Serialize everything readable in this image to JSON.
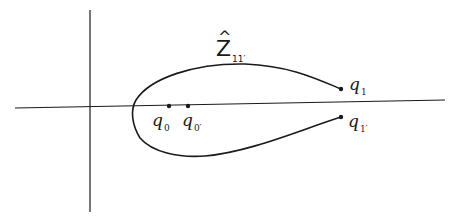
{
  "diagram": {
    "type": "curve-in-complex-plane",
    "background": "#ffffff",
    "stroke_color": "#1a1a1a",
    "axes": {
      "horizontal": {
        "x1": 15,
        "y1": 108,
        "x2": 445,
        "y2": 100
      },
      "vertical": {
        "x1": 90,
        "y1": 10,
        "x2": 90,
        "y2": 212
      }
    },
    "curve": {
      "label_main": "Z",
      "label_hat": "^",
      "label_sub": "11′",
      "path": "M341 89 C 315 78, 290 66, 245 64 C 195 63, 150 78, 136 100 C 130 110, 132 125, 140 138 C 152 152, 178 158, 205 156 C 250 152, 300 130, 341 117"
    },
    "points": [
      {
        "id": "q0",
        "label": "q",
        "sub": "0",
        "x": 169,
        "y": 106
      },
      {
        "id": "q0prime",
        "label": "q",
        "sub": "0′",
        "x": 188,
        "y": 106
      },
      {
        "id": "q1",
        "label": "q",
        "sub": "1",
        "x": 341,
        "y": 89
      },
      {
        "id": "q1prime",
        "label": "q",
        "sub": "1′",
        "x": 341,
        "y": 117
      }
    ]
  }
}
